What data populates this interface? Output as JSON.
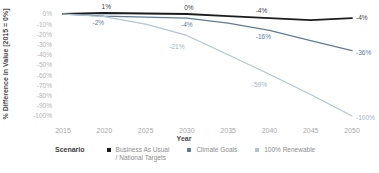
{
  "figure": {
    "legend_title": "Scenario"
  },
  "chart_data": {
    "type": "line",
    "title": "",
    "xlabel": "Year",
    "ylabel": "% Difference in Value [2015 = 0%]",
    "grid": false,
    "legend_position": "bottom",
    "x": [
      2015,
      2020,
      2025,
      2030,
      2035,
      2040,
      2045,
      2050
    ],
    "x_tick_labels": [
      "2015",
      "2020",
      "2025",
      "2030",
      "2035",
      "2040",
      "2045",
      "2050"
    ],
    "xlim": [
      2015,
      2050
    ],
    "y_ticks": [
      0,
      -10,
      -20,
      -30,
      -40,
      -50,
      -60,
      -70,
      -80,
      -90,
      -100
    ],
    "y_tick_labels": [
      "0%",
      "-10%",
      "-20%",
      "-30%",
      "-40%",
      "-50%",
      "-60%",
      "-70%",
      "-80%",
      "-90%",
      "-100%"
    ],
    "ylim": [
      -100,
      0
    ],
    "series": [
      {
        "name": "Business As Usual / National Targets",
        "legend_label_lines": [
          "Business As Usual",
          "/ National Targets"
        ],
        "color": "#1c1c1c",
        "label_color": "#3f3f3f",
        "stroke_width": 1.8,
        "values": [
          0,
          1,
          0.5,
          0,
          -2,
          -4,
          -6,
          -4
        ],
        "labels": [
          {
            "year": 2020,
            "text": "1%",
            "dx": 2,
            "dy": -4,
            "anchor": "middle"
          },
          {
            "year": 2030,
            "text": "0%",
            "dx": 2,
            "dy": -4,
            "anchor": "middle"
          },
          {
            "year": 2040,
            "text": "-4%",
            "dx": -8,
            "dy": -5,
            "anchor": "middle"
          },
          {
            "year": 2050,
            "text": "-4%",
            "dx": 4,
            "dy": 2,
            "anchor": "start"
          }
        ]
      },
      {
        "name": "Climate Goals",
        "legend_label_lines": [
          "Climate Goals"
        ],
        "color": "#5b7d9b",
        "label_color": "#5b7d9b",
        "stroke_width": 1.3,
        "values": [
          0,
          -2,
          -3,
          -4,
          -9,
          -16,
          -26,
          -36
        ],
        "labels": [
          {
            "year": 2020,
            "text": "-2%",
            "dx": -6,
            "dy": 9,
            "anchor": "middle"
          },
          {
            "year": 2030,
            "text": "-4%",
            "dx": 0,
            "dy": 9,
            "anchor": "middle"
          },
          {
            "year": 2040,
            "text": "-16%",
            "dx": -6,
            "dy": 9,
            "anchor": "middle"
          },
          {
            "year": 2050,
            "text": "-36%",
            "dx": 4,
            "dy": 4,
            "anchor": "start"
          }
        ]
      },
      {
        "name": "100% Renewable",
        "legend_label_lines": [
          "100% Renewable"
        ],
        "color": "#aec5d6",
        "label_color": "#9bb5c9",
        "stroke_width": 1.2,
        "values": [
          0,
          -2.5,
          -10,
          -21,
          -40,
          -59,
          -79,
          -100
        ],
        "labels": [
          {
            "year": 2030,
            "text": "-21%",
            "dx": -10,
            "dy": 14,
            "anchor": "middle"
          },
          {
            "year": 2040,
            "text": "-59%",
            "dx": -10,
            "dy": 13,
            "anchor": "middle"
          },
          {
            "year": 2050,
            "text": "-100%",
            "dx": 4,
            "dy": 4,
            "anchor": "start"
          }
        ]
      }
    ]
  }
}
